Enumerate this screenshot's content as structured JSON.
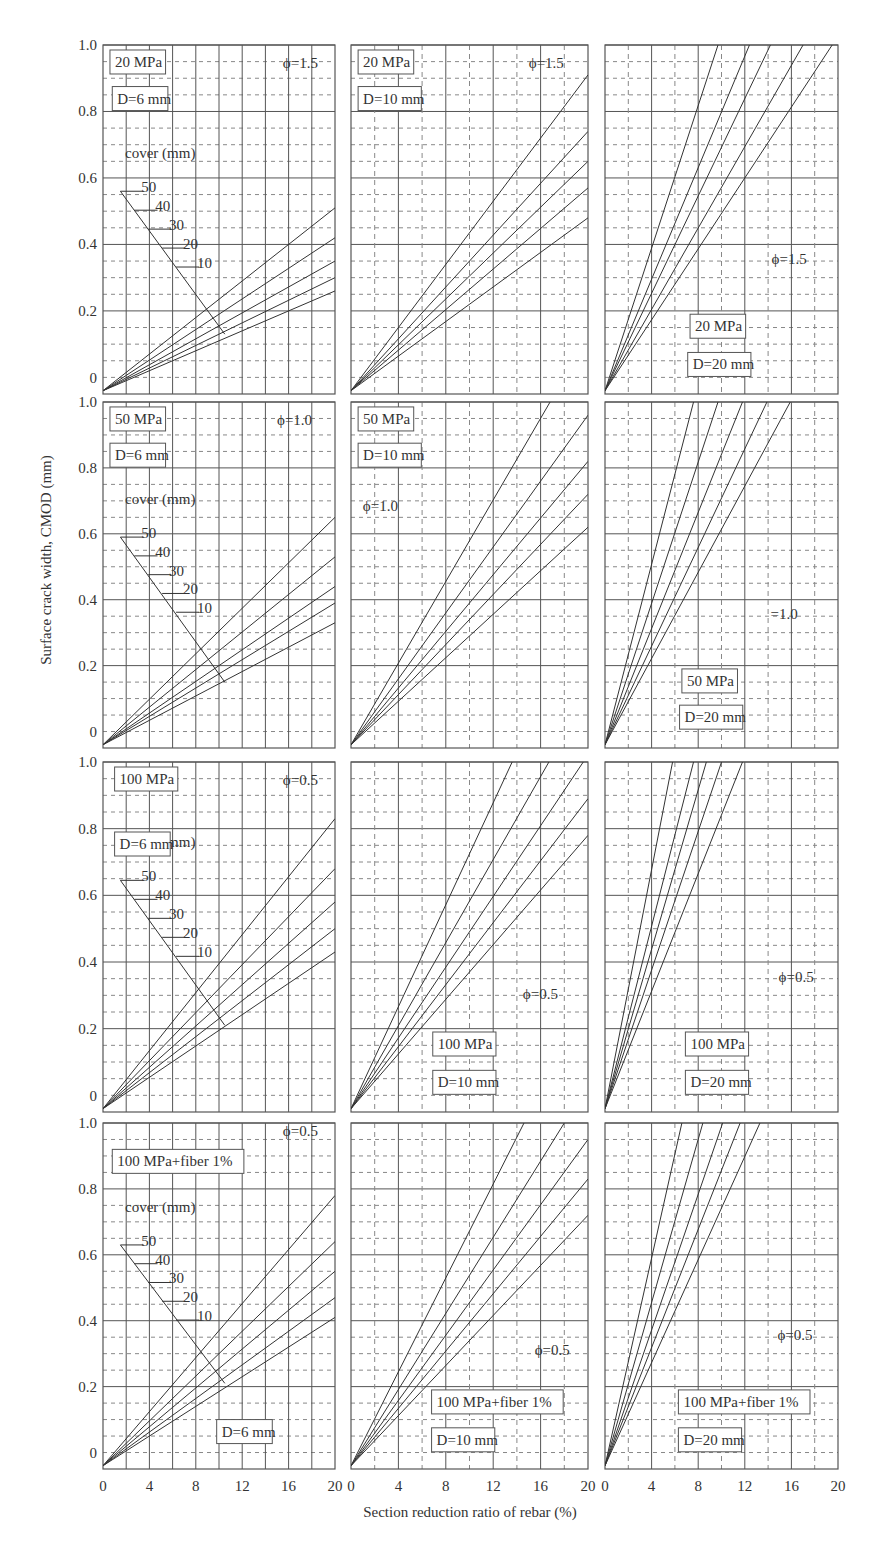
{
  "chart_data": {
    "type": "line",
    "layout": "4x3 small multiples",
    "xlabel": "Section reduction ratio of rebar (%)",
    "ylabel": "Surface crack width, CMOD (mm)",
    "xlim": [
      0,
      20
    ],
    "ylim": [
      -0.05,
      1.0
    ],
    "x_ticks": [
      "0",
      "4",
      "8",
      "12",
      "16",
      "20"
    ],
    "y_ticks": [
      "0",
      "0.2",
      "0.4",
      "0.6",
      "0.8",
      "1.0"
    ],
    "grid": true,
    "series_names": [
      "cover 10 mm",
      "cover 20 mm",
      "cover 30 mm",
      "cover 40 mm",
      "cover 50 mm"
    ],
    "cover_legend": {
      "title": "cover (mm)",
      "labels": [
        "50",
        "40",
        "30",
        "20",
        "10"
      ]
    },
    "panels": [
      {
        "row": 1,
        "col": 1,
        "strength": "20 MPa",
        "diameter": "D=6 mm",
        "phi": "ϕ=1.5",
        "has_cover_legend": true,
        "lines_y_at_x20": [
          0.51,
          0.42,
          0.35,
          0.3,
          0.26
        ]
      },
      {
        "row": 1,
        "col": 2,
        "strength": "20 MPa",
        "diameter": "D=10 mm",
        "phi": "ϕ=1.5",
        "has_cover_legend": false,
        "lines_y_at_x20": [
          0.91,
          0.74,
          0.65,
          0.57,
          0.48
        ]
      },
      {
        "row": 1,
        "col": 3,
        "strength": "20 MPa",
        "diameter": "D=20 mm",
        "phi": "ϕ=1.5",
        "has_cover_legend": false,
        "lines_x_at_y1": [
          9.7,
          12.4,
          14.2,
          17.0,
          19.5
        ]
      },
      {
        "row": 2,
        "col": 1,
        "strength": "50 MPa",
        "diameter": "D=6 mm",
        "phi": "ϕ=1.0",
        "has_cover_legend": true,
        "lines_y_at_x20": [
          0.65,
          0.53,
          0.44,
          0.39,
          0.33
        ]
      },
      {
        "row": 2,
        "col": 2,
        "strength": "50 MPa",
        "diameter": "D=10 mm",
        "phi": "ϕ=1.0",
        "has_cover_legend": false,
        "lines_x_at_y1": [
          16.8
        ],
        "lines_y_at_x20": [
          0.96,
          0.82,
          0.72,
          0.62
        ]
      },
      {
        "row": 2,
        "col": 3,
        "strength": "50 MPa",
        "diameter": "D=20 mm",
        "phi": "=1.0",
        "has_cover_legend": false,
        "lines_x_at_y1": [
          7.6,
          9.7,
          11.8,
          13.9,
          15.9
        ]
      },
      {
        "row": 3,
        "col": 1,
        "strength": "100 MPa",
        "diameter": "D=6 mm",
        "phi": "ϕ=0.5",
        "has_cover_legend": true,
        "lines_y_at_x20": [
          0.83,
          0.68,
          0.58,
          0.5,
          0.43
        ]
      },
      {
        "row": 3,
        "col": 2,
        "strength": "100 MPa",
        "diameter": "D=10 mm",
        "phi": "ϕ=0.5",
        "has_cover_legend": false,
        "lines_x_at_y1": [
          13.6,
          16.7,
          19.6
        ],
        "lines_y_at_x20": [
          0.89,
          0.78
        ]
      },
      {
        "row": 3,
        "col": 3,
        "strength": "100 MPa",
        "diameter": "D=20 mm",
        "phi": "ϕ=0.5",
        "has_cover_legend": false,
        "lines_x_at_y1": [
          5.8,
          7.6,
          8.7,
          10.0,
          11.8
        ]
      },
      {
        "row": 4,
        "col": 1,
        "strength": "100 MPa+fiber 1%",
        "diameter": "D=6 mm",
        "phi": "ϕ=0.5",
        "has_cover_legend": true,
        "lines_y_at_x20": [
          0.78,
          0.64,
          0.55,
          0.47,
          0.41
        ]
      },
      {
        "row": 4,
        "col": 2,
        "strength": "100 MPa+fiber 1%",
        "diameter": "D=10 mm",
        "phi": "ϕ=0.5",
        "has_cover_legend": false,
        "lines_x_at_y1": [
          14.6,
          18.0
        ],
        "lines_y_at_x20": [
          0.95,
          0.83,
          0.72
        ]
      },
      {
        "row": 4,
        "col": 3,
        "strength": "100 MPa+fiber 1%",
        "diameter": "D=20 mm",
        "phi": "ϕ=0.5",
        "has_cover_legend": false,
        "lines_x_at_y1": [
          6.6,
          8.4,
          10.1,
          11.6,
          13.3
        ]
      }
    ]
  },
  "colors": {
    "line": "#333333",
    "grid_major": "#555555",
    "grid_minor": "#888888",
    "frame": "#555555",
    "background": "#ffffff"
  }
}
